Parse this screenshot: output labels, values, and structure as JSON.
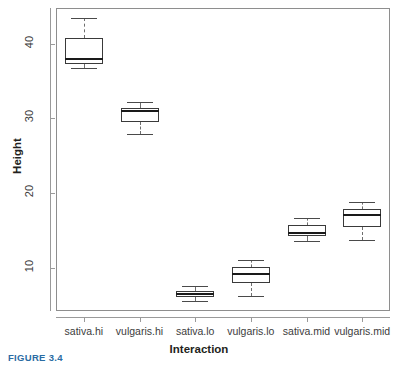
{
  "chart_data": {
    "type": "box",
    "title": "",
    "xlabel": "Interaction",
    "ylabel": "Height",
    "ylim": [
      4.2,
      44.8
    ],
    "yticks": [
      10,
      20,
      30,
      40
    ],
    "ytick_labels": [
      "10",
      "20",
      "30",
      "40"
    ],
    "grid": false,
    "legend": "none",
    "categories": [
      "sativa.hi",
      "vulgaris.hi",
      "sativa.lo",
      "vulgaris.lo",
      "sativa.mid",
      "vulgaris.mid"
    ],
    "boxes": [
      {
        "category": "sativa.hi",
        "whisker_low": 36.8,
        "q1": 37.3,
        "median": 37.9,
        "q3": 40.8,
        "whisker_high": 43.5
      },
      {
        "category": "vulgaris.hi",
        "whisker_low": 27.9,
        "q1": 29.5,
        "median": 31.0,
        "q3": 31.4,
        "whisker_high": 32.2
      },
      {
        "category": "sativa.lo",
        "whisker_low": 5.6,
        "q1": 6.1,
        "median": 6.5,
        "q3": 6.9,
        "whisker_high": 7.5
      },
      {
        "category": "vulgaris.lo",
        "whisker_low": 6.2,
        "q1": 7.9,
        "median": 9.1,
        "q3": 10.1,
        "whisker_high": 11.1
      },
      {
        "category": "sativa.mid",
        "whisker_low": 13.6,
        "q1": 14.2,
        "median": 14.7,
        "q3": 15.7,
        "whisker_high": 16.7
      },
      {
        "category": "vulgaris.mid",
        "whisker_low": 13.7,
        "q1": 15.4,
        "median": 17.0,
        "q3": 17.9,
        "whisker_high": 18.8
      }
    ]
  },
  "axes": {
    "y_title": "Height",
    "x_title": "Interaction",
    "y_tick_labels": [
      "10",
      "20",
      "30",
      "40"
    ],
    "x_tick_labels": [
      "sativa.hi",
      "vulgaris.hi",
      "sativa.lo",
      "vulgaris.lo",
      "sativa.mid",
      "vulgaris.mid"
    ]
  },
  "caption": {
    "text": "FIGURE 3.4"
  },
  "colors": {
    "box_line": "#3a3a3a",
    "median_line": "#1a1a1a",
    "whisker_line": "#6e6e6e",
    "axis_line": "#9a9a9a",
    "frame_line": "#8e8e8e",
    "text": "#231f20",
    "caption": "#2b6ca3",
    "background": "#ffffff"
  }
}
